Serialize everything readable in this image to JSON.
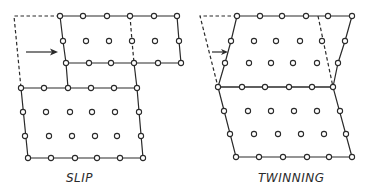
{
  "figure": {
    "panels": [
      {
        "id": "slip",
        "label": "SLIP"
      },
      {
        "id": "twinning",
        "label": "TWINNING"
      }
    ]
  },
  "icons": {
    "atom": "open-circle",
    "shear_arrow": "right-arrow"
  }
}
